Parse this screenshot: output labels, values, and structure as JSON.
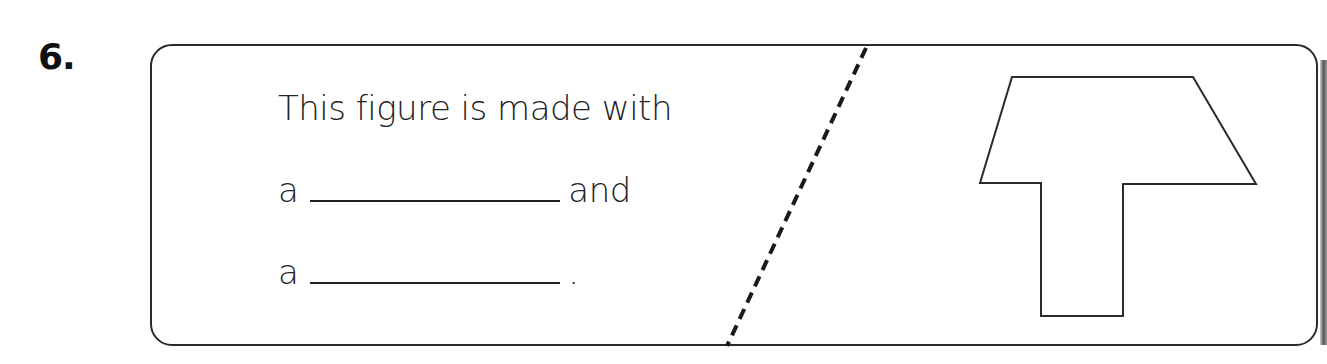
{
  "question": {
    "number": "6.",
    "prompt_line1": "This figure is made with",
    "prompt_line2_prefix": "a",
    "prompt_line2_suffix": "and",
    "prompt_line3_prefix": "a",
    "prompt_line3_suffix": ".",
    "blank1_value": "",
    "blank2_value": ""
  },
  "figure": {
    "shape-description": "trapezoid on top of a rectangle (T-like shape)",
    "stroke_color": "#2a2a2a"
  },
  "divider": {
    "style": "dashed",
    "color": "#1a1a1a"
  }
}
